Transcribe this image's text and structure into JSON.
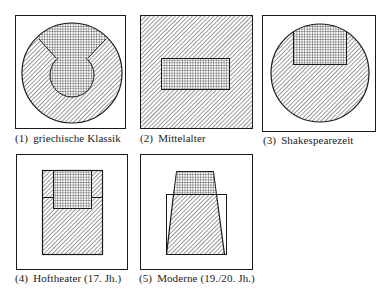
{
  "colors": {
    "ink": "#1a1a1a",
    "background": "#ffffff"
  },
  "legend_patterns": {
    "hatched": "diagonal-hatch",
    "checkered": "cross-hatch"
  },
  "panels": [
    {
      "number": "(1)",
      "label": "griechische Klassik"
    },
    {
      "number": "(2)",
      "label": "Mittelalter"
    },
    {
      "number": "(3)",
      "label": "Shakespearezeit"
    },
    {
      "number": "(4)",
      "label": "Hoftheater (17. Jh.)"
    },
    {
      "number": "(5)",
      "label": "Moderne (19./20. Jh.)"
    }
  ]
}
